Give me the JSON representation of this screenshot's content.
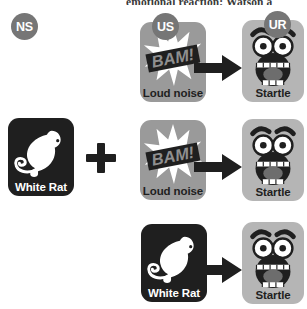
{
  "page": {
    "top_partial_text": "emotional reaction; Watson a",
    "background_color": "#ffffff"
  },
  "colors": {
    "badge_gray": "#767676",
    "card_dark": "#1f1f1f",
    "card_gray": "#9a9a9a",
    "card_light": "#b5b5b5",
    "label_light": "#ffffff",
    "label_dark": "#1f1f1f",
    "arrow": "#1f1f1f",
    "plus": "#1f1f1f"
  },
  "badges": {
    "ns": "NS",
    "us": "US",
    "ur": "UR"
  },
  "cards": {
    "white_rat": {
      "label": "White Rat",
      "icon": "rat-silhouette-icon"
    },
    "loud_noise": {
      "label": "Loud noise",
      "icon": "starburst-icon",
      "burst_text": "BAM!"
    },
    "startle": {
      "label": "Startle",
      "icon": "startled-face-icon"
    }
  },
  "operators": {
    "plus": "+",
    "arrow": "→"
  },
  "rows": [
    {
      "name": "row-unconditioned",
      "left_items": [
        "loud_noise"
      ],
      "right_item": "startle",
      "left_badge": "US",
      "right_badge": "UR"
    },
    {
      "name": "row-pairing",
      "left_items": [
        "white_rat",
        "loud_noise"
      ],
      "right_item": "startle",
      "operator": "+"
    },
    {
      "name": "row-conditioned",
      "left_items": [
        "white_rat"
      ],
      "right_item": "startle"
    }
  ]
}
